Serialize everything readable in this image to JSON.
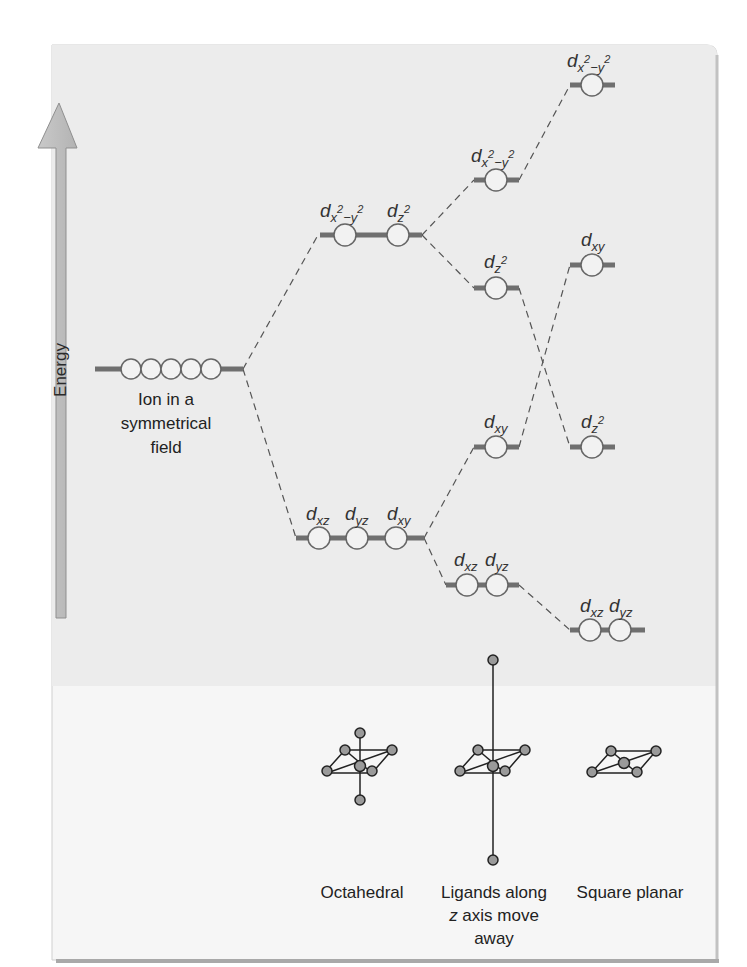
{
  "figure": {
    "axis_label": "Energy",
    "colors": {
      "panel_upper": "#ececec",
      "panel_lower": "#f6f6f6",
      "panel_border": "#bdbdbd",
      "arrow_fill": "#bcbcbc",
      "arrow_stroke": "#8f8f8f",
      "level_line": "#6f6f6f",
      "orbital_stroke": "#666666",
      "connector": "#555555"
    },
    "columns": [
      {
        "id": "symmetric",
        "caption_lines": [
          "Ion in a",
          "symmetrical",
          "field"
        ],
        "levels": [
          {
            "orbitals": [
              "d",
              "d",
              "d",
              "d",
              "d"
            ],
            "label": "",
            "degenerate_count": 5
          }
        ]
      },
      {
        "id": "octahedral",
        "caption": "Octahedral",
        "levels": [
          {
            "group": "eg",
            "labels": [
              {
                "base": "d",
                "sub": "x",
                "sup": "2",
                "sub2": "−y",
                "sup2": "2"
              },
              {
                "base": "d",
                "sub": "z",
                "sup": "2"
              }
            ],
            "text": [
              "dx²−y²",
              "dz²"
            ]
          },
          {
            "group": "t2g",
            "labels": [
              {
                "base": "d",
                "sub": "xz"
              },
              {
                "base": "d",
                "sub": "yz"
              },
              {
                "base": "d",
                "sub": "xy"
              }
            ],
            "text": [
              "dxz",
              "dyz",
              "dxy"
            ]
          }
        ]
      },
      {
        "id": "tetragonal",
        "caption_lines": [
          "Ligands along",
          "z axis move",
          "away"
        ],
        "levels": [
          {
            "text": "dx²−y²"
          },
          {
            "text": "dz²"
          },
          {
            "text": "dxy"
          },
          {
            "text": [
              "dxz",
              "dyz"
            ]
          }
        ]
      },
      {
        "id": "square_planar",
        "caption": "Square planar",
        "levels": [
          {
            "text": "dx²−y²"
          },
          {
            "text": "dxy"
          },
          {
            "text": "dz²"
          },
          {
            "text": [
              "dxz",
              "dyz"
            ]
          }
        ]
      }
    ],
    "captions": {
      "octahedral": "Octahedral",
      "tetragonal_1": "Ligands along",
      "tetragonal_2_italic": "z",
      "tetragonal_2_rest": " axis move",
      "tetragonal_3": "away",
      "square_planar": "Square planar",
      "ion_1": "Ion in a",
      "ion_2": "symmetrical",
      "ion_3": "field"
    },
    "orbital_labels": {
      "d": "d",
      "x2y2_sub_x": "x",
      "x2y2_sup_2a": "2",
      "x2y2_sub_minus_y": "−y",
      "x2y2_sup_2b": "2",
      "z2_sub": "z",
      "z2_sup": "2",
      "xy": "xy",
      "xz": "xz",
      "yz": "yz"
    }
  }
}
